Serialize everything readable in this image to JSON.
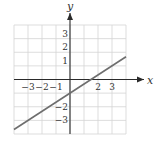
{
  "chart_data": {
    "type": "line",
    "title": "",
    "xlabel": "x",
    "ylabel": "y",
    "xlim": [
      -4,
      4
    ],
    "ylim": [
      -4,
      4
    ],
    "grid": true,
    "x_tick_labels": [
      "-3",
      "-2",
      "-1",
      "2",
      "3"
    ],
    "x_tick_values": [
      -3,
      -2,
      -1,
      2,
      3
    ],
    "y_tick_labels": [
      "3",
      "2",
      "1",
      "-2",
      "-3"
    ],
    "y_tick_values": [
      3,
      2,
      1,
      -2,
      -3
    ],
    "series": [
      {
        "name": "y = (2/3)x - 1",
        "x": [
          -4,
          4
        ],
        "y": [
          -3.667,
          1.667
        ],
        "slope": 0.6667,
        "intercept": -1,
        "color": "#6e6e6e"
      }
    ]
  },
  "axes": {
    "x_label": "x",
    "y_label": "y",
    "grid_color": "#d4d4d4",
    "axis_color": "#2a2a2a"
  }
}
